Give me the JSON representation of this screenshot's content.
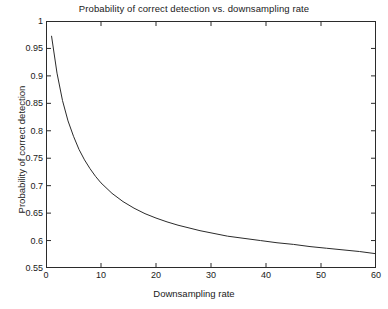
{
  "chart_data": {
    "type": "line",
    "title": "Probability of correct detection vs. downsampling rate",
    "xlabel": "Downsampling rate",
    "ylabel": "Probability of correct detection",
    "xlim": [
      0,
      60
    ],
    "ylim": [
      0.55,
      1
    ],
    "xticks": [
      0,
      10,
      20,
      30,
      40,
      50,
      60
    ],
    "xtick_labels": [
      "0",
      "10",
      "20",
      "30",
      "40",
      "50",
      "60"
    ],
    "yticks": [
      0.55,
      0.6,
      0.65,
      0.7,
      0.75,
      0.8,
      0.85,
      0.9,
      0.95,
      1
    ],
    "ytick_labels": [
      "0.55",
      "0.6",
      "0.65",
      "0.7",
      "0.75",
      "0.8",
      "0.85",
      "0.9",
      "0.95",
      "1"
    ],
    "grid": false,
    "legend": null,
    "line_color": "#2b2b2b",
    "line_width": 1,
    "background": "#ffffff",
    "series": [
      {
        "name": "Probability of correct detection",
        "x": [
          1,
          2,
          3,
          4,
          5,
          6,
          7,
          8,
          9,
          10,
          12,
          14,
          16,
          18,
          20,
          22,
          24,
          26,
          28,
          30,
          33,
          36,
          39,
          42,
          45,
          48,
          51,
          54,
          57,
          60
        ],
        "values": [
          0.973,
          0.905,
          0.855,
          0.818,
          0.79,
          0.766,
          0.747,
          0.731,
          0.717,
          0.705,
          0.686,
          0.671,
          0.659,
          0.649,
          0.641,
          0.634,
          0.628,
          0.623,
          0.618,
          0.614,
          0.608,
          0.604,
          0.6,
          0.596,
          0.593,
          0.589,
          0.586,
          0.583,
          0.58,
          0.576
        ]
      }
    ]
  }
}
